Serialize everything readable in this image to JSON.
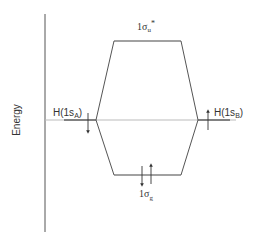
{
  "diagram": {
    "type": "molecular-orbital-energy-diagram",
    "axis_label": "Energy",
    "orbitals": {
      "left_atomic": {
        "label_main": "H(1s",
        "label_sub": "A",
        "label_close": ")",
        "electrons": [
          "down"
        ]
      },
      "right_atomic": {
        "label_main": "H(1s",
        "label_sub": "B",
        "label_close": ")",
        "electrons": [
          "up"
        ]
      },
      "antibonding": {
        "label_main": "1σ",
        "label_sub": "u",
        "label_sup": "*",
        "electrons": []
      },
      "bonding": {
        "label_main": "1σ",
        "label_sub": "g",
        "electrons": [
          "down",
          "up"
        ]
      }
    },
    "colors": {
      "line": "#444444",
      "reference_line": "#bbbbbb",
      "text": "#333333"
    }
  }
}
